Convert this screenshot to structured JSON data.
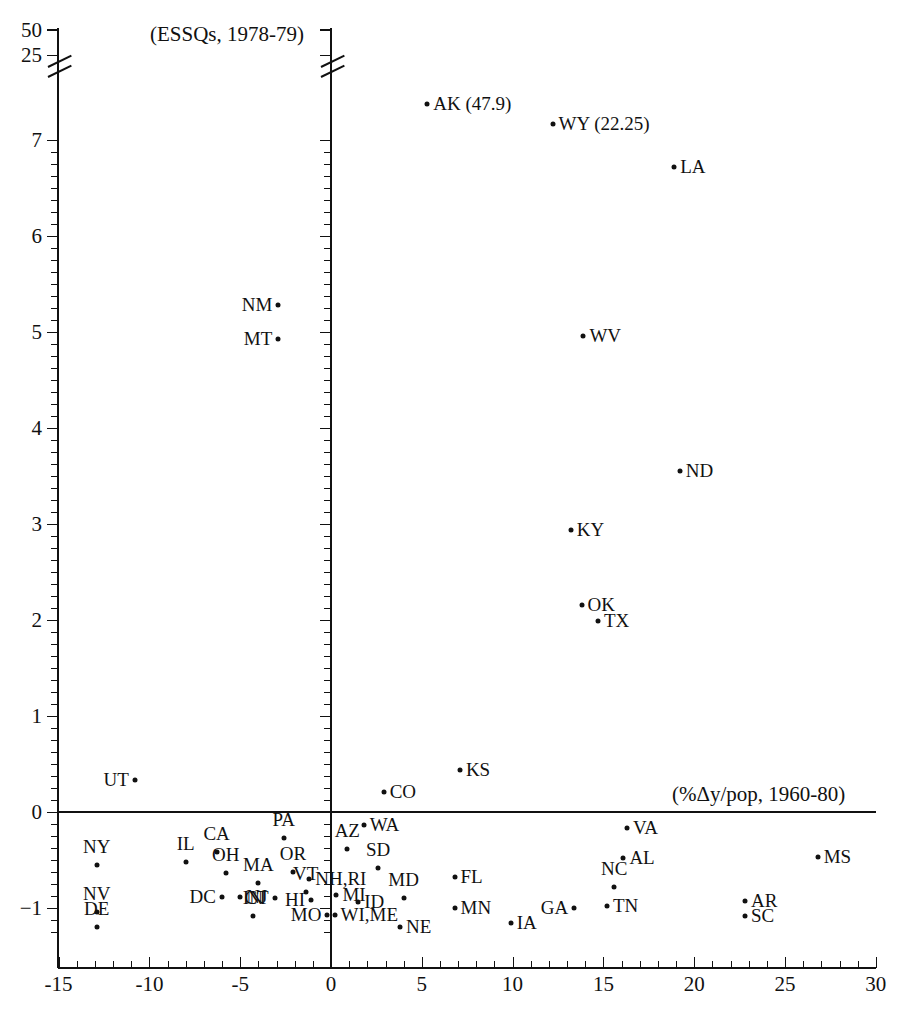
{
  "chart_data": {
    "type": "scatter",
    "title": "(ESSQs, 1978-79)",
    "xlabel": "(%Δy/pop, 1960-80)",
    "ylabel": "(ESSQs, 1978-79)",
    "xlim": [
      -15,
      30
    ],
    "ylim": [
      -1.35,
      7.4
    ],
    "grid": false,
    "legend": "none",
    "axis_break": {
      "axis": "y",
      "note": "y-axis is broken above 7; compressed ticks shown for 25 and 50",
      "upper_ticks": [
        25,
        50
      ]
    },
    "xticks": [
      -15,
      -10,
      -5,
      0,
      5,
      10,
      15,
      20,
      25,
      30
    ],
    "xtick_labels": [
      "-15",
      "-10",
      "-5",
      "0",
      "5",
      "10",
      "15",
      "20",
      "25",
      "30"
    ],
    "yticks": [
      -1,
      0,
      1,
      2,
      3,
      4,
      5,
      6,
      7,
      25,
      50
    ],
    "ytick_labels": [
      "-1",
      "0",
      "1",
      "2",
      "3",
      "4",
      "5",
      "6",
      "7",
      "25",
      "50"
    ],
    "points": [
      {
        "label": "AK",
        "x": 5.3,
        "y": 7.38,
        "pos": "r",
        "value_note": "(47.9)",
        "display": "AK (47.9)"
      },
      {
        "label": "WY",
        "x": 12.2,
        "y": 7.17,
        "pos": "r",
        "value_note": "(22.25)",
        "display": "WY (22.25)"
      },
      {
        "label": "LA",
        "x": 18.9,
        "y": 6.72,
        "pos": "r",
        "display": "LA"
      },
      {
        "label": "NM",
        "x": -2.9,
        "y": 5.28,
        "pos": "l",
        "display": "NM"
      },
      {
        "label": "MT",
        "x": -2.9,
        "y": 4.93,
        "pos": "l",
        "display": "MT"
      },
      {
        "label": "WV",
        "x": 13.9,
        "y": 4.96,
        "pos": "r",
        "display": "WV"
      },
      {
        "label": "ND",
        "x": 19.2,
        "y": 3.55,
        "pos": "r",
        "display": "ND"
      },
      {
        "label": "KY",
        "x": 13.2,
        "y": 2.94,
        "pos": "r",
        "display": "KY"
      },
      {
        "label": "OK",
        "x": 13.8,
        "y": 2.16,
        "pos": "r",
        "display": "OK"
      },
      {
        "label": "TX",
        "x": 14.7,
        "y": 1.99,
        "pos": "r",
        "display": "TX"
      },
      {
        "label": "KS",
        "x": 7.1,
        "y": 0.44,
        "pos": "r",
        "display": "KS"
      },
      {
        "label": "UT",
        "x": -10.8,
        "y": 0.33,
        "pos": "l",
        "display": "UT"
      },
      {
        "label": "CO",
        "x": 2.9,
        "y": 0.21,
        "pos": "r",
        "display": "CO"
      },
      {
        "label": "WA",
        "x": 1.8,
        "y": -0.13,
        "pos": "r",
        "display": "WA"
      },
      {
        "label": "VA",
        "x": 16.3,
        "y": -0.17,
        "pos": "r",
        "display": "VA"
      },
      {
        "label": "PA",
        "x": -2.6,
        "y": -0.27,
        "pos": "t",
        "display": "PA"
      },
      {
        "label": "AZ",
        "x": 0.9,
        "y": -0.38,
        "pos": "t",
        "display": "AZ"
      },
      {
        "label": "CA",
        "x": -6.3,
        "y": -0.42,
        "pos": "t",
        "display": "CA"
      },
      {
        "label": "AL",
        "x": 16.1,
        "y": -0.48,
        "pos": "r",
        "display": "AL"
      },
      {
        "label": "MS",
        "x": 26.8,
        "y": -0.47,
        "pos": "r",
        "display": "MS"
      },
      {
        "label": "IL",
        "x": -8.0,
        "y": -0.52,
        "pos": "t",
        "display": "IL"
      },
      {
        "label": "SD",
        "x": 2.6,
        "y": -0.58,
        "pos": "t",
        "display": "SD"
      },
      {
        "label": "OR",
        "x": -2.1,
        "y": -0.62,
        "pos": "t",
        "display": "OR"
      },
      {
        "label": "OH",
        "x": -5.8,
        "y": -0.63,
        "pos": "t",
        "display": "OH"
      },
      {
        "label": "FL",
        "x": 6.8,
        "y": -0.68,
        "pos": "r",
        "display": "FL"
      },
      {
        "label": "NH,RI",
        "x": -1.2,
        "y": -0.7,
        "pos": "r",
        "display": "NH,RI"
      },
      {
        "label": "MA",
        "x": -4.0,
        "y": -0.74,
        "pos": "t",
        "display": "MA"
      },
      {
        "label": "NC",
        "x": 15.6,
        "y": -0.78,
        "pos": "t",
        "display": "NC"
      },
      {
        "label": "VT",
        "x": -1.4,
        "y": -0.83,
        "pos": "t",
        "display": "VT"
      },
      {
        "label": "MI",
        "x": 0.3,
        "y": -0.86,
        "pos": "r",
        "display": "MI"
      },
      {
        "label": "MD",
        "x": 4.0,
        "y": -0.9,
        "pos": "t",
        "display": "MD"
      },
      {
        "label": "NJ",
        "x": -5.0,
        "y": -0.89,
        "pos": "r",
        "display": "NJ"
      },
      {
        "label": "DC",
        "x": -6.0,
        "y": -0.89,
        "pos": "l",
        "display": "DC"
      },
      {
        "label": "CT",
        "x": -3.1,
        "y": -0.9,
        "pos": "l",
        "display": "CT"
      },
      {
        "label": "HI",
        "x": -1.1,
        "y": -0.92,
        "pos": "l",
        "display": "HI"
      },
      {
        "label": "ID",
        "x": 1.5,
        "y": -0.94,
        "pos": "r",
        "display": "ID"
      },
      {
        "label": "TN",
        "x": 15.2,
        "y": -0.98,
        "pos": "r",
        "display": "TN"
      },
      {
        "label": "AR",
        "x": 22.8,
        "y": -0.93,
        "pos": "r",
        "display": "AR"
      },
      {
        "label": "MN",
        "x": 6.8,
        "y": -1.0,
        "pos": "r",
        "display": "MN"
      },
      {
        "label": "GA",
        "x": 13.4,
        "y": -1.0,
        "pos": "l",
        "display": "GA"
      },
      {
        "label": "SC",
        "x": 22.8,
        "y": -1.08,
        "pos": "r",
        "display": "SC"
      },
      {
        "label": "IN",
        "x": -4.3,
        "y": -1.08,
        "pos": "t",
        "display": "IN"
      },
      {
        "label": "NY",
        "x": -12.9,
        "y": -0.55,
        "pos": "t",
        "display": "NY"
      },
      {
        "label": "NV",
        "x": -12.9,
        "y": -1.04,
        "pos": "t",
        "display": "NV"
      },
      {
        "label": "MO",
        "x": -0.2,
        "y": -1.07,
        "pos": "l",
        "display": "MO"
      },
      {
        "label": "WI,ME",
        "x": 0.2,
        "y": -1.07,
        "pos": "r",
        "display": "WI,ME"
      },
      {
        "label": "DE",
        "x": -12.9,
        "y": -1.2,
        "pos": "t",
        "display": "DE"
      },
      {
        "label": "IA",
        "x": 9.9,
        "y": -1.16,
        "pos": "r",
        "display": "IA"
      },
      {
        "label": "NE",
        "x": 3.8,
        "y": -1.2,
        "pos": "r",
        "display": "NE"
      }
    ]
  },
  "axis": {
    "x_label_text": "(%Δy/pop, 1960-80)",
    "top_label_text": "(ESSQs, 1978-79)",
    "x_tick_labels": [
      "-15",
      "-10",
      "-5",
      "0",
      "5",
      "10",
      "15",
      "20",
      "25",
      "30"
    ],
    "y_tick_labels_main": [
      "7",
      "6",
      "5",
      "4",
      "3",
      "2",
      "1",
      "0",
      "-1"
    ],
    "y_tick_labels_upper": [
      "50",
      "25"
    ]
  },
  "style": {
    "ink": "#111111",
    "paper": "#ffffff"
  }
}
